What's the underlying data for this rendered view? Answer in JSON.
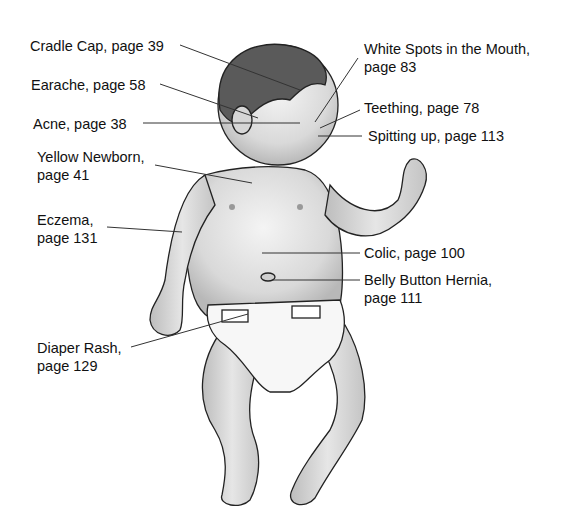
{
  "diagram": {
    "labels": [
      {
        "id": "cradle-cap",
        "line1": "Cradle Cap, page 39",
        "line2": ""
      },
      {
        "id": "earache",
        "line1": "Earache, page 58",
        "line2": ""
      },
      {
        "id": "acne",
        "line1": "Acne, page 38",
        "line2": ""
      },
      {
        "id": "yellow-newborn",
        "line1": "Yellow Newborn,",
        "line2": "page 41"
      },
      {
        "id": "eczema",
        "line1": "Eczema,",
        "line2": "page 131"
      },
      {
        "id": "diaper-rash",
        "line1": "Diaper Rash,",
        "line2": "page 129"
      },
      {
        "id": "white-spots",
        "line1": "White Spots in the Mouth,",
        "line2": "page 83"
      },
      {
        "id": "teething",
        "line1": "Teething, page 78",
        "line2": ""
      },
      {
        "id": "spitting-up",
        "line1": "Spitting up, page 113",
        "line2": ""
      },
      {
        "id": "colic",
        "line1": "Colic, page 100",
        "line2": ""
      },
      {
        "id": "belly-button-hernia",
        "line1": "Belly Button Hernia,",
        "line2": "page 111"
      }
    ]
  }
}
